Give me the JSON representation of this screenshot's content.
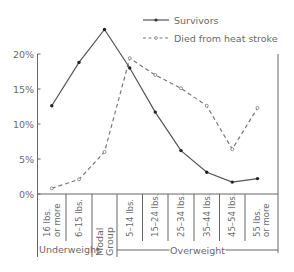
{
  "chart_data": {
    "type": "line",
    "title": "",
    "xlabel": "",
    "ylabel": "",
    "ylim": [
      0,
      20
    ],
    "yticks": [
      "0%",
      "5%",
      "10%",
      "15%",
      "20%"
    ],
    "ytick_values": [
      0,
      5,
      10,
      15,
      20
    ],
    "grid": false,
    "legend_position": "top-right",
    "categories": [
      "16 lbs. or more",
      "6–15 lbs.",
      "Modal Group",
      "5–14 lbs.",
      "15–24 lbs.",
      "25–34 lbs.",
      "35–44 lbs.",
      "45–54 lbs.",
      "55 lbs. or more"
    ],
    "category_label_lines": [
      [
        "16 lbs.",
        "or more"
      ],
      [
        "6–15 lbs."
      ],
      [
        "Modal",
        "Group"
      ],
      [
        "5–14 lbs."
      ],
      [
        "15–24 lbs."
      ],
      [
        "25–34 lbs."
      ],
      [
        "35–44 lbs."
      ],
      [
        "45–54 lbs."
      ],
      [
        "55 lbs.",
        "or more"
      ]
    ],
    "category_groups": [
      {
        "label": "Underweight",
        "from": 0,
        "to": 1
      },
      {
        "label": "",
        "from": 2,
        "to": 2
      },
      {
        "label": "Overweight",
        "from": 3,
        "to": 8
      }
    ],
    "series": [
      {
        "name": "Survivors",
        "style": "solid",
        "marker": "filled-dot",
        "color": "#555555",
        "values": [
          12.6,
          18.8,
          23.5,
          18.0,
          11.7,
          6.2,
          3.1,
          1.7,
          2.2
        ]
      },
      {
        "name": "Died from heat stroke",
        "style": "dashed",
        "marker": "open-dot",
        "color": "#777777",
        "values": [
          0.8,
          2.1,
          6.0,
          19.4,
          17.0,
          15.1,
          12.6,
          6.4,
          12.3
        ]
      }
    ]
  },
  "legend": {
    "items": [
      {
        "label": "Survivors"
      },
      {
        "label": "Died from heat stroke"
      }
    ]
  }
}
